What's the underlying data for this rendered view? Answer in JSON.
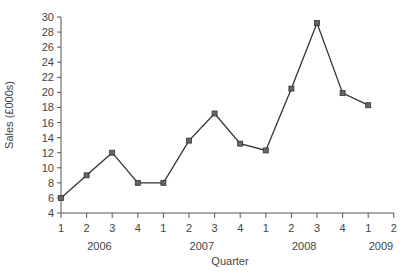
{
  "chart_data": {
    "type": "line",
    "title": "",
    "xlabel": "Quarter",
    "ylabel": "Sales (£000s)",
    "ylim": [
      4,
      30
    ],
    "yticks": [
      4,
      6,
      8,
      10,
      12,
      14,
      16,
      18,
      20,
      22,
      24,
      26,
      28,
      30
    ],
    "xtick_labels": [
      "1",
      "2",
      "3",
      "4",
      "1",
      "2",
      "3",
      "4",
      "1",
      "2",
      "3",
      "4",
      "1",
      "2"
    ],
    "year_labels": [
      {
        "label": "2006",
        "position": 2.5
      },
      {
        "label": "2007",
        "position": 6.5
      },
      {
        "label": "2008",
        "position": 10.5
      },
      {
        "label": "2009",
        "position": 13.5
      }
    ],
    "grid": false,
    "legend": null,
    "x": [
      "2006 Q1",
      "2006 Q2",
      "2006 Q3",
      "2006 Q4",
      "2007 Q1",
      "2007 Q2",
      "2007 Q3",
      "2007 Q4",
      "2008 Q1",
      "2008 Q2",
      "2008 Q3",
      "2008 Q4",
      "2009 Q1"
    ],
    "series": [
      {
        "name": "Sales",
        "values": [
          6,
          9,
          12,
          8,
          8,
          13.6,
          17.2,
          13.2,
          12.3,
          20.5,
          29.2,
          19.9,
          18.3
        ]
      }
    ]
  },
  "colors": {
    "line": "#333333",
    "marker": "#666666",
    "axis": "#555555",
    "text": "#444444"
  }
}
